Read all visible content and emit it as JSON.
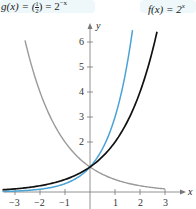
{
  "chart_data": {
    "type": "line",
    "title": "",
    "xlabel": "x",
    "ylabel": "y",
    "xlim": [
      -3.5,
      4
    ],
    "ylim": [
      0,
      7
    ],
    "x_ticks": [
      -3,
      -2,
      -1,
      1,
      2,
      3
    ],
    "y_ticks": [
      2,
      3,
      4,
      5,
      6
    ],
    "grid": false,
    "series": [
      {
        "name": "g(x) = (1/2)^x = 2^-x",
        "function": "2^-x",
        "color": "#9a9a9a",
        "x": [
          -2.6,
          -2,
          -1,
          0,
          1,
          2,
          3
        ],
        "values": [
          6.06,
          4,
          2,
          1,
          0.5,
          0.25,
          0.125
        ]
      },
      {
        "name": "3^x",
        "function": "3^x",
        "color": "#4aa3d6",
        "x": [
          -3.5,
          -3,
          -2,
          -1,
          0,
          1,
          1.7
        ],
        "values": [
          0.02,
          0.037,
          0.111,
          0.333,
          1,
          3,
          6.47
        ]
      },
      {
        "name": "f(x) = 2^x",
        "function": "2^x",
        "color": "#111111",
        "x": [
          -3.5,
          -3,
          -2,
          -1,
          0,
          1,
          2,
          2.68
        ],
        "values": [
          0.088,
          0.125,
          0.25,
          0.5,
          1,
          2,
          4,
          6.4
        ]
      }
    ]
  },
  "labels": {
    "g_label_left": "g(x) = (",
    "g_frac_num": "1",
    "g_frac_den": "2",
    "g_label_right": ") = 2",
    "g_exp": "−x",
    "f_label": "f(x) = 2",
    "f_exp": "x",
    "x_axis": "x",
    "y_axis": "y"
  },
  "tick_labels": {
    "x": [
      "−3",
      "−2",
      "−1",
      "1",
      "2",
      "3"
    ],
    "y": [
      "2",
      "3",
      "4",
      "5",
      "6"
    ]
  }
}
